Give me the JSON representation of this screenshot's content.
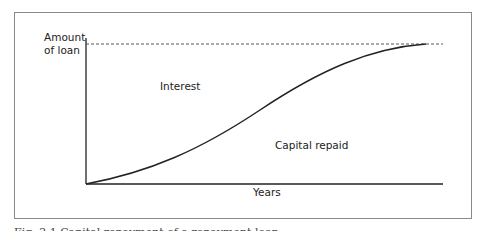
{
  "diagram": {
    "y_axis_label_line1": "Amount",
    "y_axis_label_line2": "of loan",
    "x_axis_label": "Years",
    "region_upper_label": "Interest",
    "region_lower_label": "Capital repaid",
    "caption": "Fig. 2.1 Capital repayment of a repayment loan"
  },
  "colors": {
    "line": "#222222",
    "dashed": "#555555",
    "frame": "#8a8a8a"
  }
}
